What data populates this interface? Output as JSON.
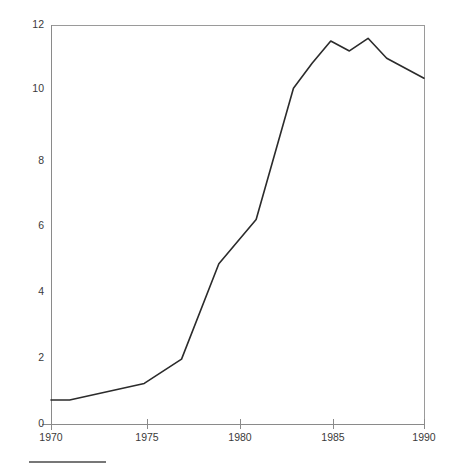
{
  "chart_data": {
    "type": "line",
    "title": "",
    "subtitle": "",
    "xlabel": "",
    "ylabel": "",
    "xlim": [
      1970,
      1990
    ],
    "ylim": [
      0,
      12
    ],
    "grid": false,
    "legend": null,
    "x_ticks": [
      1970,
      1975,
      1980,
      1985,
      1990
    ],
    "y_ticks": [
      0,
      2,
      4,
      6,
      8,
      10,
      12
    ],
    "x_tick_labels": [
      "1970",
      "1975",
      "1980",
      "1985",
      "1990"
    ],
    "y_tick_labels": [
      "0",
      "2",
      "4",
      "6",
      "8",
      "10",
      "12"
    ],
    "series": [
      {
        "name": "series-1",
        "color": "#2b2b2b",
        "x": [
          1970,
          1971,
          1975,
          1977,
          1979,
          1981,
          1983,
          1984,
          1985,
          1986,
          1987,
          1988,
          1990
        ],
        "values": [
          0.72,
          0.72,
          1.22,
          1.95,
          4.82,
          6.15,
          10.1,
          10.85,
          11.52,
          11.22,
          11.6,
          11.0,
          10.4
        ]
      }
    ]
  },
  "axes": {
    "y_axis_name": "value-axis",
    "x_axis_name": "year-axis"
  },
  "footer": {
    "rule_present": true
  }
}
